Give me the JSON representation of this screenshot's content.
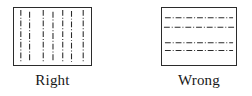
{
  "figure": {
    "type": "line-style-comparison-diagram",
    "background_color": "#ffffff",
    "line_color": "#2b2b2b",
    "border_color": "#2b2b2b"
  },
  "panels": [
    {
      "id": "right-example",
      "caption": "Right",
      "hatch_orientation": "vertical",
      "line_style": "dash-dot",
      "line_count": 7,
      "description": "Box filled with vertical dash-dot section lines",
      "box": {
        "x": 13,
        "y": 7,
        "width": 79,
        "height": 59
      },
      "line_positions": [
        5,
        14,
        28,
        38,
        48,
        57,
        70
      ],
      "dash_pattern": "6 2 1 2"
    },
    {
      "id": "wrong-example",
      "caption": "Wrong",
      "hatch_orientation": "horizontal",
      "line_style": "dash-dot",
      "line_count": 4,
      "description": "Box filled with horizontal dash-dot section lines",
      "box": {
        "x": 161,
        "y": 7,
        "width": 76,
        "height": 59
      },
      "line_positions": [
        9,
        19,
        35,
        43
      ],
      "dash_pattern": "6 2 1 2"
    }
  ],
  "captions": {
    "right": "Right",
    "wrong": "Wrong"
  }
}
